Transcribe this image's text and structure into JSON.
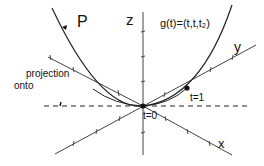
{
  "diagram": {
    "curve_label": "P",
    "formula": "g(t)=(t,t,t₂)",
    "axes": {
      "z": "z",
      "y": "y",
      "x": "x"
    },
    "projection_label_line1": "projection",
    "projection_label_line2": "onto",
    "points": [
      {
        "label": "t=0"
      },
      {
        "label": "t=1"
      }
    ],
    "colors": {
      "stroke": "#222222",
      "background": "#ffffff"
    }
  }
}
